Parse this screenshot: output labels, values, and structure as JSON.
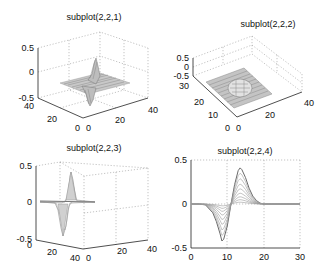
{
  "figure": {
    "width": 326,
    "height": 274,
    "background": "#ffffff",
    "line_color": "#8a8a8a"
  },
  "chart_data": [
    {
      "type": "surface",
      "title": "subplot(2,2,1)",
      "view": "3d-default",
      "x_ticks": [
        "0",
        "20",
        "40"
      ],
      "y_ticks": [
        "0",
        "20",
        "40"
      ],
      "z_ticks": [
        "-0.5",
        "0",
        "0.5"
      ],
      "xlim": [
        0,
        40
      ],
      "ylim": [
        0,
        40
      ],
      "zlim": [
        -0.5,
        0.5
      ],
      "grid": true,
      "description": "Mesh of a bipolar peak (derivative of Gaussian) centered on a 40x40 grid; peak ~+0.4, trough ~-0.4"
    },
    {
      "type": "surface",
      "title": "subplot(2,2,2)",
      "view": "3d-top-oblique",
      "x_ticks": [
        "0",
        "20",
        "40"
      ],
      "y_ticks": [
        "0",
        "10",
        "20",
        "30"
      ],
      "z_ticks": [
        "-0.5",
        "0",
        "0.5"
      ],
      "xlim": [
        0,
        40
      ],
      "ylim": [
        0,
        30
      ],
      "zlim": [
        -0.5,
        0.5
      ],
      "grid": true,
      "description": "Same surface viewed from above at a high elevation angle"
    },
    {
      "type": "surface",
      "title": "subplot(2,2,3)",
      "view": "3d-side",
      "x_ticks": [
        "0",
        "20",
        "40"
      ],
      "y_ticks": [
        "0",
        "20",
        "40"
      ],
      "z_ticks": [
        "-0.5",
        "0",
        "0.5"
      ],
      "xlim": [
        0,
        40
      ],
      "ylim": [
        0,
        40
      ],
      "zlim": [
        -0.5,
        0.5
      ],
      "grid": true,
      "description": "Same surface viewed from the side, showing +0.5 peak and -0.45 trough"
    },
    {
      "type": "line",
      "title": "subplot(2,2,4)",
      "view": "2d-side-projection",
      "x_ticks": [
        "0",
        "10",
        "20",
        "30"
      ],
      "y_ticks": [
        "-0.5",
        "0",
        "0.5"
      ],
      "xlim": [
        0,
        30
      ],
      "ylim": [
        -0.5,
        0.5
      ],
      "grid": true,
      "series_description": "Family of curves (mesh rows) of derivative-of-Gaussian profile; zero crossing at x=11, max ~0.4 at x~13.5, min ~-0.42 at x~8.5, flat beyond x~20",
      "envelope": {
        "x": [
          0,
          2,
          4,
          6,
          7,
          8,
          8.5,
          9,
          10,
          11,
          12,
          13,
          13.5,
          14,
          15,
          16,
          17,
          18,
          19,
          20,
          22,
          30
        ],
        "y": [
          0,
          0,
          -0.01,
          -0.1,
          -0.2,
          -0.34,
          -0.42,
          -0.4,
          -0.25,
          0,
          0.22,
          0.38,
          0.41,
          0.39,
          0.3,
          0.18,
          0.09,
          0.04,
          0.01,
          0,
          0,
          0
        ]
      }
    }
  ]
}
